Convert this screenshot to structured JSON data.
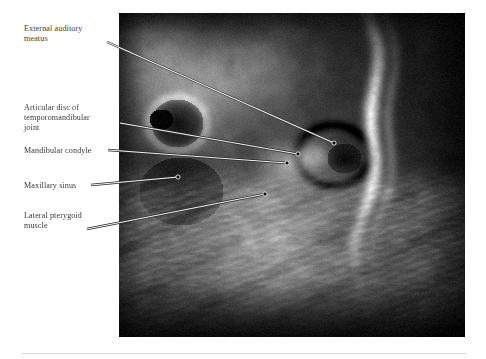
{
  "figure": {
    "kind": "annotated-mri-figure",
    "modality": "MRI",
    "view": "sagittal temporomandibular joint",
    "image_panel": {
      "x": 119,
      "y": 13,
      "width": 346,
      "height": 324,
      "background_color": "#050505"
    },
    "text_color": "#3b3936",
    "leader_color": "#2b2b2b",
    "rule_color": "#d8d8d8"
  },
  "labels": [
    {
      "id": "external-auditory-meatus",
      "text": "External auditory\nmeatus",
      "x": 24,
      "y": 24,
      "anchor": {
        "x": 107,
        "y": 42
      },
      "target": {
        "x": 334,
        "y": 143
      }
    },
    {
      "id": "articular-disc",
      "text": "Articular disc of\ntemporomandibular\njoint",
      "x": 24,
      "y": 103,
      "anchor": {
        "x": 120,
        "y": 123
      },
      "target": {
        "x": 298,
        "y": 154
      }
    },
    {
      "id": "mandibular-condyle",
      "text": "Mandibular condyle",
      "x": 24,
      "y": 146,
      "anchor": {
        "x": 108,
        "y": 150
      },
      "target": {
        "x": 287,
        "y": 163
      }
    },
    {
      "id": "maxillary-sinus",
      "text": "Maxillary sinus",
      "x": 24,
      "y": 181,
      "anchor": {
        "x": 91,
        "y": 185
      },
      "target": {
        "x": 178,
        "y": 177
      }
    },
    {
      "id": "lateral-pterygoid-muscle",
      "text": "Lateral pterygoid\nmuscle",
      "x": 24,
      "y": 211,
      "anchor": {
        "x": 87,
        "y": 229
      },
      "target": {
        "x": 265,
        "y": 194
      }
    }
  ],
  "chart_data": {
    "type": "table",
    "categories": [
      "External auditory meatus",
      "Articular disc of temporomandibular joint",
      "Mandibular condyle",
      "Maxillary sinus",
      "Lateral pterygoid muscle"
    ],
    "values": [
      1,
      2,
      3,
      4,
      5
    ],
    "xlabel": "",
    "ylabel": "",
    "legend_position": "left"
  }
}
